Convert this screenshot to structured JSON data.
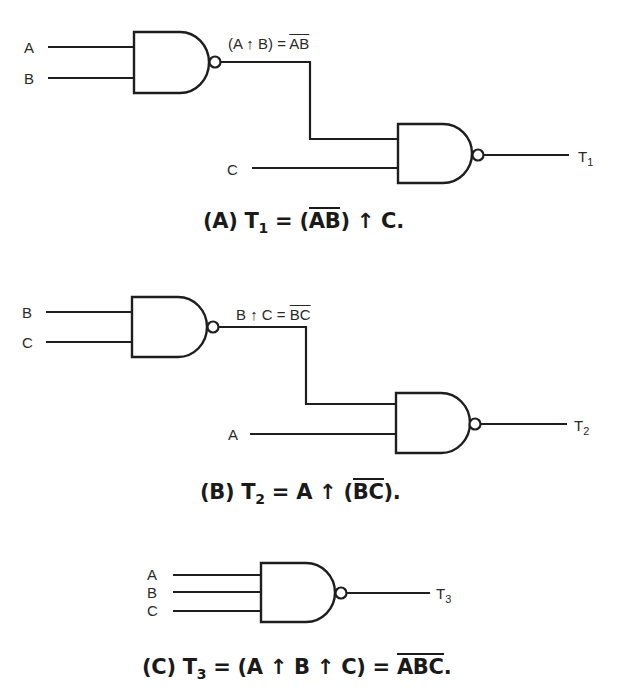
{
  "figure": {
    "circuit_a": {
      "inputs": [
        "A",
        "B",
        "C"
      ],
      "intermediate_label": {
        "prefix": "(A ",
        "op": "↑",
        "mid": " B) = ",
        "overline": "AB"
      },
      "output_label": {
        "main": "T",
        "sub": "1"
      },
      "caption": {
        "tag": "(A)",
        "lhs_main": "T",
        "lhs_sub": "1",
        "eq": "=",
        "open": "(",
        "overline": "AB",
        "close": ")",
        "op": "↑",
        "rhs": "C."
      }
    },
    "circuit_b": {
      "inputs": [
        "B",
        "C",
        "A"
      ],
      "intermediate_label": {
        "prefix": "B ",
        "op": "↑",
        "mid": " C = ",
        "overline": "BC"
      },
      "output_label": {
        "main": "T",
        "sub": "2"
      },
      "caption": {
        "tag": "(B)",
        "lhs_main": "T",
        "lhs_sub": "2",
        "eq": "=",
        "pre": "A",
        "op": "↑",
        "open": "(",
        "overline": "BC",
        "close": ").",
        "rhs": ""
      }
    },
    "circuit_c": {
      "inputs": [
        "A",
        "B",
        "C"
      ],
      "output_label": {
        "main": "T",
        "sub": "3"
      },
      "caption": {
        "tag": "(C)",
        "lhs_main": "T",
        "lhs_sub": "3",
        "eq": "=",
        "expr": "(A ↑ B ↑ C)",
        "eq2": "=",
        "overline": "ABC",
        "end": "."
      }
    },
    "gate_type": "NAND",
    "colors": {
      "line": "#1e1e1e",
      "text": "#1a1a1a",
      "background": "#ffffff"
    }
  }
}
